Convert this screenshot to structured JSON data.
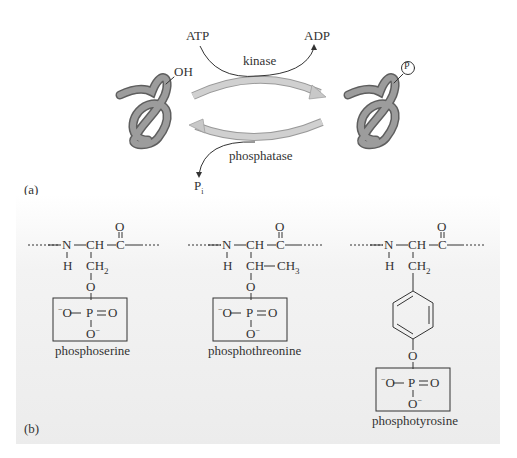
{
  "figure": {
    "panel_a": {
      "label": "(a)",
      "reactant_group": "OH",
      "product_group": "P",
      "forward": {
        "enzyme": "kinase",
        "input": "ATP",
        "output": "ADP"
      },
      "reverse": {
        "enzyme": "phosphatase",
        "output": "P",
        "output_subscript": "i"
      }
    },
    "panel_b": {
      "label": "(b)",
      "structures": [
        {
          "name": "phosphoserine",
          "backbone": [
            "N",
            "CH",
            "C"
          ],
          "carbonyl_o": "O",
          "nh": "H",
          "side_chain": "CH",
          "side_sub": "2",
          "side_extra": "",
          "bridge_o": "O",
          "phosphate": {
            "left": "O",
            "center": "P",
            "right": "O",
            "bottom": "O"
          }
        },
        {
          "name": "phosphothreonine",
          "backbone": [
            "N",
            "CH",
            "C"
          ],
          "carbonyl_o": "O",
          "nh": "H",
          "side_chain": "CH",
          "side_sub": "",
          "side_extra": "CH",
          "side_extra_sub": "3",
          "bridge_o": "O",
          "phosphate": {
            "left": "O",
            "center": "P",
            "right": "O",
            "bottom": "O"
          }
        },
        {
          "name": "phosphotyrosine",
          "backbone": [
            "N",
            "CH",
            "C"
          ],
          "carbonyl_o": "O",
          "nh": "H",
          "side_chain": "CH",
          "side_sub": "2",
          "ring": "benzene",
          "bridge_o": "O",
          "phosphate": {
            "left": "O",
            "center": "P",
            "right": "O",
            "bottom": "O"
          }
        }
      ]
    },
    "colors": {
      "protein": "#8a8a8a",
      "arrow": "#c8c8c8",
      "text": "#333333",
      "panel_bg": "#eeeeee"
    }
  }
}
